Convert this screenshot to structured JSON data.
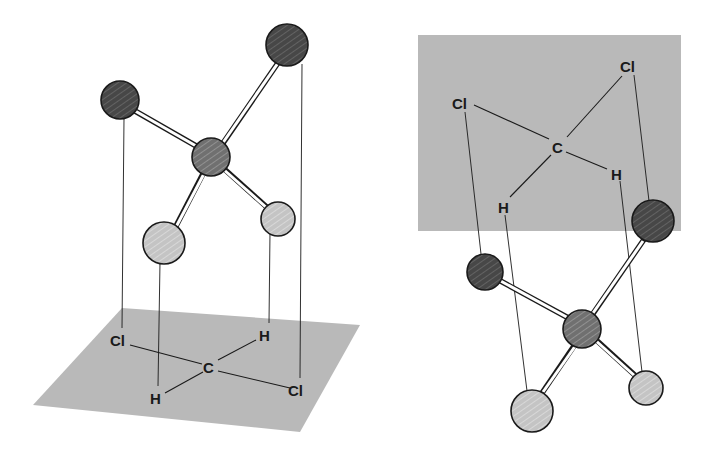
{
  "figure": {
    "colors": {
      "background": "#ffffff",
      "plane": "#b9b9b9",
      "chlorine_atom": "#4a4a4a",
      "carbon_atom": "#7a7a7a",
      "hydrogen_atom": "#c8c8c8",
      "outline": "#1a1a1a",
      "bond_fill": "#ffffff"
    },
    "left": {
      "plane_shape": "parallelogram (horizontal plane below model)",
      "projection_labels": {
        "cl_left": "Cl",
        "h_back": "H",
        "c_center": "C",
        "h_front": "H",
        "cl_right": "Cl"
      },
      "atoms": [
        {
          "element": "Cl",
          "role": "chlorine-upper-left"
        },
        {
          "element": "Cl",
          "role": "chlorine-upper-right"
        },
        {
          "element": "C",
          "role": "carbon-center"
        },
        {
          "element": "H",
          "role": "hydrogen-lower-left"
        },
        {
          "element": "H",
          "role": "hydrogen-lower-right"
        }
      ]
    },
    "right": {
      "plane_shape": "rectangle (plane above model)",
      "projection_labels": {
        "cl_left": "Cl",
        "cl_right": "Cl",
        "c_center": "C",
        "h_right": "H",
        "h_left": "H"
      },
      "atoms": [
        {
          "element": "Cl",
          "role": "chlorine-left"
        },
        {
          "element": "Cl",
          "role": "chlorine-upper-right"
        },
        {
          "element": "C",
          "role": "carbon-center"
        },
        {
          "element": "H",
          "role": "hydrogen-lower-left"
        },
        {
          "element": "H",
          "role": "hydrogen-lower-right"
        }
      ]
    }
  }
}
